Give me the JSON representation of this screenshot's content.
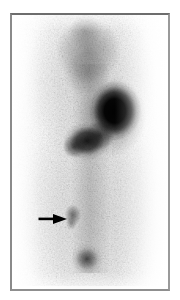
{
  "image": {
    "kind": "scintigram",
    "modality": "nuclear-medicine-scintigraphy",
    "view": "anterior-whole-body",
    "orientation": "portrait",
    "colormap": "grayscale-inverted",
    "caption": "",
    "frame": {
      "border_color": "#7d7d7d",
      "background_color": "#ffffff"
    }
  },
  "scan": {
    "background_color": "#ffffff",
    "max_intensity_color": "#000000",
    "regions": [
      {
        "id": "upper-diffuse-uptake",
        "label": "Diffuse upper-thoracic uptake",
        "intensity": "low-moderate",
        "shape": "triangular-diffuse",
        "center_pct": {
          "x": 48,
          "y": 15
        }
      },
      {
        "id": "dominant-focus",
        "label": "Intense focal uptake",
        "intensity": "very-high",
        "shape": "round",
        "center_pct": {
          "x": 66,
          "y": 35
        }
      },
      {
        "id": "secondary-focus",
        "label": "Adjacent inferomedial uptake",
        "intensity": "high",
        "shape": "elongated",
        "center_pct": {
          "x": 48,
          "y": 46
        }
      },
      {
        "id": "midline-band",
        "label": "Faint midline activity",
        "intensity": "very-low",
        "shape": "vertical-band",
        "center_pct": {
          "x": 50,
          "y": 55
        }
      },
      {
        "id": "arrow-lesion",
        "label": "Small focal lesion (arrowed)",
        "intensity": "low",
        "shape": "small-round",
        "center_pct": {
          "x": 39,
          "y": 73
        }
      },
      {
        "id": "bladder-focus",
        "label": "Inferior midline focus",
        "intensity": "moderate-high",
        "shape": "oval",
        "center_pct": {
          "x": 48,
          "y": 89
        }
      }
    ]
  },
  "annotation": {
    "arrow": {
      "id": "lesion-arrow",
      "color": "#000000",
      "direction": "right",
      "points_to": "arrow-lesion",
      "tip_pct": {
        "x": 33,
        "y": 73
      }
    }
  }
}
